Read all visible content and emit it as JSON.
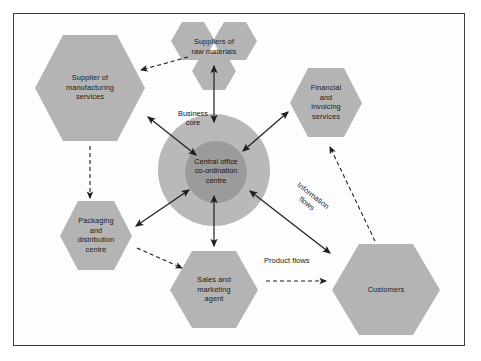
{
  "diagram": {
    "colors": {
      "hexagon_fill": "#b4b4b4",
      "outer_circle_fill": "#b9b9b9",
      "inner_circle_fill": "#9b9b9b",
      "arrow": "#1f1f1f",
      "frame_border": "#3b3b3b",
      "background": "#fdfdfd",
      "text": "#1b1b1b"
    },
    "core": {
      "outer_label": "Business\ncore",
      "inner_label": "Central office\nco-ordination\ncentre"
    },
    "nodes": [
      {
        "id": "supplier-manufacturing",
        "label": "Supplier of\nmanufacturing\nservices"
      },
      {
        "id": "suppliers-raw-materials",
        "label": "Suppliers of\nraw materials"
      },
      {
        "id": "financial-invoicing",
        "label": "Financial\nand\ninvoicing\nservices"
      },
      {
        "id": "packaging-distribution",
        "label": "Packaging\nand\ndistribution\ncentre"
      },
      {
        "id": "sales-marketing",
        "label": "Sales and\nmarketing\nagent"
      },
      {
        "id": "customers",
        "label": "Customers"
      }
    ],
    "flow_legend": [
      {
        "id": "information-flows",
        "label": "Information\nflows",
        "style": "solid-double-arrow"
      },
      {
        "id": "product-flows",
        "label": "Product flows",
        "style": "dashed-arrow"
      }
    ]
  }
}
